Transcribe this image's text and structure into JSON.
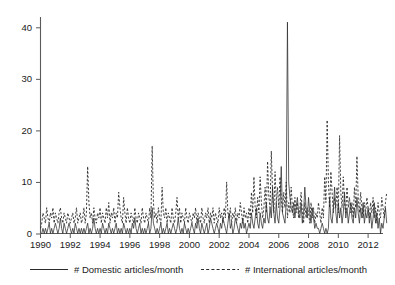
{
  "chart_data": {
    "type": "line",
    "title": "",
    "subtitle": "",
    "xlabel": "",
    "ylabel": "",
    "xlim": [
      1990,
      2013
    ],
    "ylim": [
      0,
      42
    ],
    "grid": false,
    "legend_position": "bottom",
    "x_ticks": [
      1990,
      1992,
      1994,
      1996,
      1998,
      2000,
      2002,
      2004,
      2006,
      2008,
      2010,
      2012
    ],
    "x_tick_labels": [
      "1990",
      "1992",
      "1994",
      "1996",
      "1998",
      "2000",
      "2002",
      "2004",
      "2006",
      "2008",
      "2010",
      "2012"
    ],
    "y_ticks": [
      0,
      10,
      20,
      30,
      40
    ],
    "y_tick_labels": [
      "0",
      "10",
      "20",
      "30",
      "40"
    ],
    "x_start": 1990.0,
    "x_step_months": 1,
    "series": [
      {
        "name": "# Domestic articles/month",
        "style": "solid",
        "color": "#2b2b2b",
        "values": [
          0,
          0,
          1,
          0,
          1,
          0,
          1,
          2,
          0,
          1,
          0,
          1,
          2,
          1,
          0,
          1,
          3,
          1,
          0,
          2,
          1,
          0,
          1,
          2,
          1,
          0,
          1,
          0,
          2,
          1,
          0,
          1,
          0,
          1,
          0,
          1,
          0,
          1,
          2,
          0,
          1,
          0,
          1,
          3,
          1,
          0,
          1,
          0,
          1,
          0,
          2,
          1,
          0,
          1,
          0,
          2,
          1,
          0,
          1,
          0,
          1,
          2,
          0,
          1,
          0,
          1,
          0,
          2,
          1,
          0,
          1,
          0,
          1,
          0,
          2,
          1,
          3,
          1,
          0,
          1,
          2,
          0,
          1,
          0,
          1,
          0,
          1,
          2,
          0,
          1,
          5,
          2,
          1,
          0,
          1,
          0,
          1,
          2,
          0,
          1,
          0,
          1,
          2,
          0,
          1,
          0,
          1,
          2,
          1,
          0,
          1,
          3,
          1,
          0,
          1,
          0,
          2,
          1,
          0,
          1,
          0,
          1,
          2,
          1,
          0,
          2,
          1,
          3,
          1,
          0,
          2,
          1,
          0,
          1,
          2,
          0,
          1,
          3,
          2,
          1,
          0,
          1,
          2,
          1,
          0,
          2,
          1,
          3,
          2,
          1,
          0,
          2,
          4,
          1,
          2,
          0,
          1,
          3,
          2,
          1,
          0,
          2,
          1,
          3,
          1,
          2,
          0,
          1,
          2,
          1,
          4,
          2,
          1,
          3,
          5,
          2,
          1,
          4,
          2,
          1,
          3,
          2,
          6,
          3,
          2,
          5,
          3,
          9,
          4,
          2,
          6,
          3,
          2,
          5,
          13,
          4,
          3,
          2,
          6,
          41,
          10,
          7,
          5,
          4,
          6,
          3,
          5,
          7,
          4,
          3,
          6,
          2,
          4,
          9,
          5,
          3,
          7,
          4,
          2,
          5,
          3,
          1,
          2,
          1,
          1,
          0,
          1,
          2,
          1,
          0,
          1,
          0,
          1,
          7,
          3,
          2,
          5,
          9,
          4,
          2,
          6,
          3,
          5,
          2,
          4,
          8,
          3,
          5,
          2,
          4,
          6,
          3,
          2,
          5,
          3,
          7,
          4,
          2,
          5,
          3,
          6,
          2,
          4,
          3,
          5,
          2,
          4,
          1,
          3,
          6,
          2,
          4,
          1,
          3,
          0,
          2,
          1,
          3,
          5,
          2
        ]
      },
      {
        "name": "# International articles/month",
        "style": "dashed",
        "color": "#2b2b2b",
        "values": [
          1,
          2,
          4,
          3,
          2,
          5,
          3,
          2,
          4,
          3,
          5,
          2,
          4,
          3,
          2,
          4,
          5,
          3,
          2,
          4,
          3,
          2,
          4,
          3,
          2,
          3,
          4,
          2,
          3,
          5,
          2,
          3,
          4,
          2,
          3,
          5,
          2,
          4,
          13,
          6,
          3,
          4,
          2,
          5,
          3,
          2,
          4,
          3,
          5,
          2,
          4,
          3,
          2,
          5,
          3,
          6,
          2,
          4,
          3,
          5,
          2,
          4,
          3,
          8,
          5,
          3,
          2,
          7,
          4,
          2,
          5,
          3,
          2,
          4,
          3,
          2,
          5,
          3,
          2,
          4,
          3,
          2,
          5,
          3,
          2,
          4,
          3,
          2,
          5,
          3,
          17,
          6,
          3,
          4,
          2,
          5,
          3,
          2,
          9,
          4,
          3,
          5,
          2,
          4,
          3,
          2,
          5,
          3,
          2,
          4,
          7,
          3,
          5,
          2,
          4,
          3,
          2,
          5,
          3,
          2,
          4,
          3,
          2,
          4,
          3,
          5,
          2,
          4,
          3,
          2,
          5,
          3,
          2,
          4,
          3,
          5,
          2,
          4,
          3,
          5,
          2,
          4,
          3,
          2,
          5,
          3,
          4,
          2,
          5,
          3,
          10,
          4,
          3,
          5,
          2,
          4,
          3,
          5,
          2,
          4,
          3,
          6,
          4,
          2,
          5,
          3,
          4,
          2,
          5,
          3,
          8,
          4,
          11,
          5,
          3,
          7,
          4,
          11,
          6,
          3,
          5,
          9,
          4,
          14,
          7,
          5,
          16,
          8,
          4,
          12,
          6,
          9,
          5,
          11,
          7,
          4,
          8,
          5,
          10,
          3,
          6,
          4,
          9,
          5,
          3,
          7,
          4,
          6,
          3,
          5,
          8,
          4,
          2,
          6,
          3,
          5,
          4,
          2,
          6,
          3,
          5,
          2,
          4,
          3,
          6,
          4,
          2,
          5,
          3,
          11,
          6,
          22,
          10,
          5,
          12,
          8,
          4,
          7,
          5,
          9,
          4,
          19,
          8,
          5,
          11,
          6,
          4,
          9,
          5,
          7,
          4,
          6,
          3,
          9,
          5,
          15,
          7,
          4,
          8,
          5,
          3,
          6,
          4,
          7,
          5,
          3,
          6,
          4,
          7,
          3,
          5,
          2,
          6,
          4,
          3,
          7,
          5,
          3,
          6,
          8
        ]
      }
    ]
  },
  "legend": {
    "items": [
      {
        "label": "# Domestic articles/month",
        "style": "solid"
      },
      {
        "label": "# International articles/month",
        "style": "dashed"
      }
    ]
  }
}
